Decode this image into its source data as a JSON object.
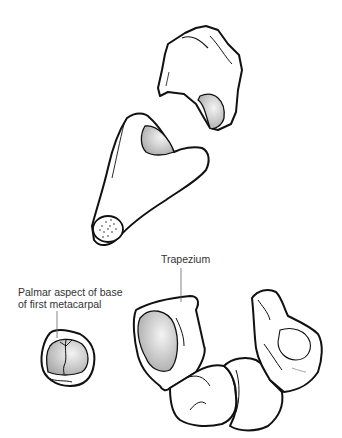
{
  "labels": {
    "trapezium": "Trapezium",
    "palmar_line1": "Palmar aspect of base",
    "palmar_line2": "of first metacarpal"
  },
  "colors": {
    "stroke": "#111111",
    "fill": "#ffffff",
    "articular_shade": "#cfcfcf"
  }
}
